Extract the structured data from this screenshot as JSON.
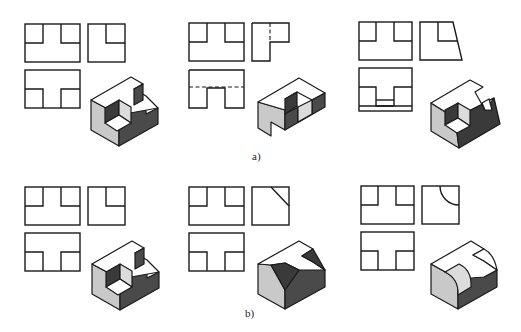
{
  "figure": {
    "rows": [
      {
        "label": "a)",
        "panels": [
          {
            "id": "a1",
            "description": "Block with T-shaped top recess and square through-pocket",
            "views": [
              "front",
              "side",
              "top",
              "isometric"
            ]
          },
          {
            "id": "a2",
            "description": "Block with hidden-line slot (dashed lines in side and top views)",
            "views": [
              "front",
              "side",
              "top",
              "isometric"
            ]
          },
          {
            "id": "a3",
            "description": "Block with slanted side face and stepped bottom",
            "views": [
              "front",
              "side",
              "top",
              "isometric"
            ]
          }
        ]
      },
      {
        "label": "b)",
        "panels": [
          {
            "id": "b1",
            "description": "Block with T-shaped recess (reference)",
            "views": [
              "front",
              "side",
              "top",
              "isometric"
            ]
          },
          {
            "id": "b2",
            "description": "Block with chamfered corner (diagonal line in side view)",
            "views": [
              "front",
              "side",
              "top",
              "isometric"
            ]
          },
          {
            "id": "b3",
            "description": "Block with rounded concave corner (arc in side view)",
            "views": [
              "front",
              "side",
              "top",
              "isometric"
            ]
          }
        ]
      }
    ],
    "colors": {
      "line": "#1a1a1a",
      "face_top": "#ffffff",
      "face_left": "#c9c9c9",
      "face_right": "#4a4a4a",
      "background": "#ffffff"
    }
  }
}
